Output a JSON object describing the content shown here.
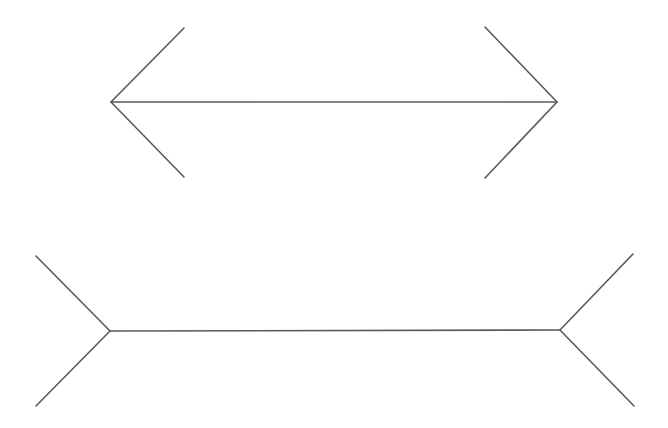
{
  "diagram": {
    "type": "muller-lyer-illusion",
    "background": "#ffffff",
    "stroke_color": "#5a5a5a",
    "stroke_width": 1.6,
    "figures": [
      {
        "name": "top-figure-arrowheads-inward",
        "shaft": {
          "x1": 111,
          "y1": 102,
          "x2": 557,
          "y2": 102
        },
        "fins": [
          {
            "x1": 111,
            "y1": 102,
            "x2": 184,
            "y2": 28
          },
          {
            "x1": 111,
            "y1": 102,
            "x2": 184,
            "y2": 177
          },
          {
            "x1": 557,
            "y1": 102,
            "x2": 485,
            "y2": 27
          },
          {
            "x1": 557,
            "y1": 102,
            "x2": 485,
            "y2": 178
          }
        ]
      },
      {
        "name": "bottom-figure-fins-outward",
        "shaft": {
          "x1": 110,
          "y1": 331,
          "x2": 560,
          "y2": 330
        },
        "fins": [
          {
            "x1": 110,
            "y1": 331,
            "x2": 36,
            "y2": 256
          },
          {
            "x1": 110,
            "y1": 331,
            "x2": 36,
            "y2": 406
          },
          {
            "x1": 560,
            "y1": 330,
            "x2": 633,
            "y2": 254
          },
          {
            "x1": 560,
            "y1": 330,
            "x2": 634,
            "y2": 406
          }
        ]
      }
    ]
  }
}
